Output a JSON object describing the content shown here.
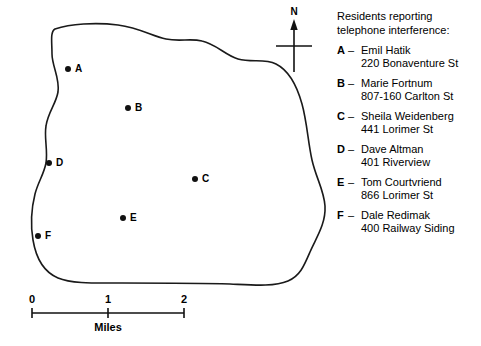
{
  "map": {
    "title": "telephone-interference-map",
    "outline_color": "#1a1a1a",
    "background_color": "#ffffff",
    "points": [
      {
        "label": "A",
        "x": 68,
        "y": 69
      },
      {
        "label": "B",
        "x": 128,
        "y": 108
      },
      {
        "label": "C",
        "x": 195,
        "y": 179
      },
      {
        "label": "D",
        "x": 49,
        "y": 163
      },
      {
        "label": "E",
        "x": 123,
        "y": 218
      },
      {
        "label": "F",
        "x": 38,
        "y": 236
      }
    ]
  },
  "compass": {
    "north_label": "N",
    "icon": "compass-north-arrow-icon"
  },
  "scale": {
    "ticks": [
      "0",
      "1",
      "2"
    ],
    "units_label": "Miles",
    "min": 0,
    "max": 2
  },
  "legend": {
    "heading": "Residents reporting telephone interference:",
    "separator": "–",
    "entries": [
      {
        "key": "A",
        "name": "Emil Hatik",
        "address": "220 Bonaventure St"
      },
      {
        "key": "B",
        "name": "Marie Fortnum",
        "address": "807-160 Carlton St"
      },
      {
        "key": "C",
        "name": "Sheila Weidenberg",
        "address": "441 Lorimer St"
      },
      {
        "key": "D",
        "name": "Dave Altman",
        "address": "401 Riverview"
      },
      {
        "key": "E",
        "name": "Tom Courtvriend",
        "address": "866 Lorimer St"
      },
      {
        "key": "F",
        "name": "Dale Redimak",
        "address": "400 Railway Siding"
      }
    ]
  }
}
